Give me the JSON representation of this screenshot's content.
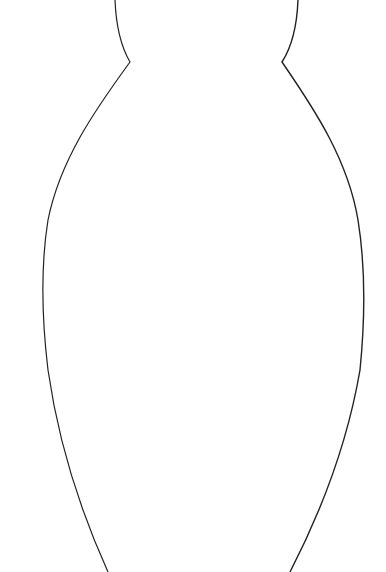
{
  "drawing": {
    "subject": "vase-outline",
    "background": "#ffffff",
    "stroke_color": "#222222",
    "stroke_width": 1.2
  }
}
